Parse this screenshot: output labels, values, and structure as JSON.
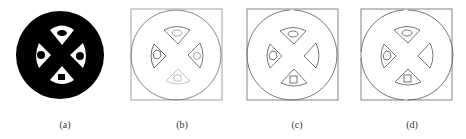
{
  "figure": {
    "panels": [
      {
        "id": "a",
        "label": "(a)",
        "style": "filled",
        "label_x": 65
      },
      {
        "id": "b",
        "label": "(b)",
        "style": "outline-faint",
        "label_x": 182
      },
      {
        "id": "c",
        "label": "(c)",
        "style": "outline",
        "label_x": 297
      },
      {
        "id": "d",
        "label": "(d)",
        "style": "outline",
        "label_x": 412
      }
    ],
    "shapes": {
      "outer": "circle",
      "inner": [
        {
          "position": "top",
          "sector": "fan-down",
          "hole": "ellipse"
        },
        {
          "position": "left",
          "sector": "fan-right",
          "hole": "hexagon"
        },
        {
          "position": "right",
          "sector": "fan-left",
          "hole": "circle"
        },
        {
          "position": "bottom",
          "sector": "fan-up",
          "hole": "square"
        }
      ]
    },
    "colors": {
      "fill": "#000000",
      "stroke_dark": "#555555",
      "stroke_faint": "#9a9a9a",
      "background": "#ffffff"
    }
  }
}
